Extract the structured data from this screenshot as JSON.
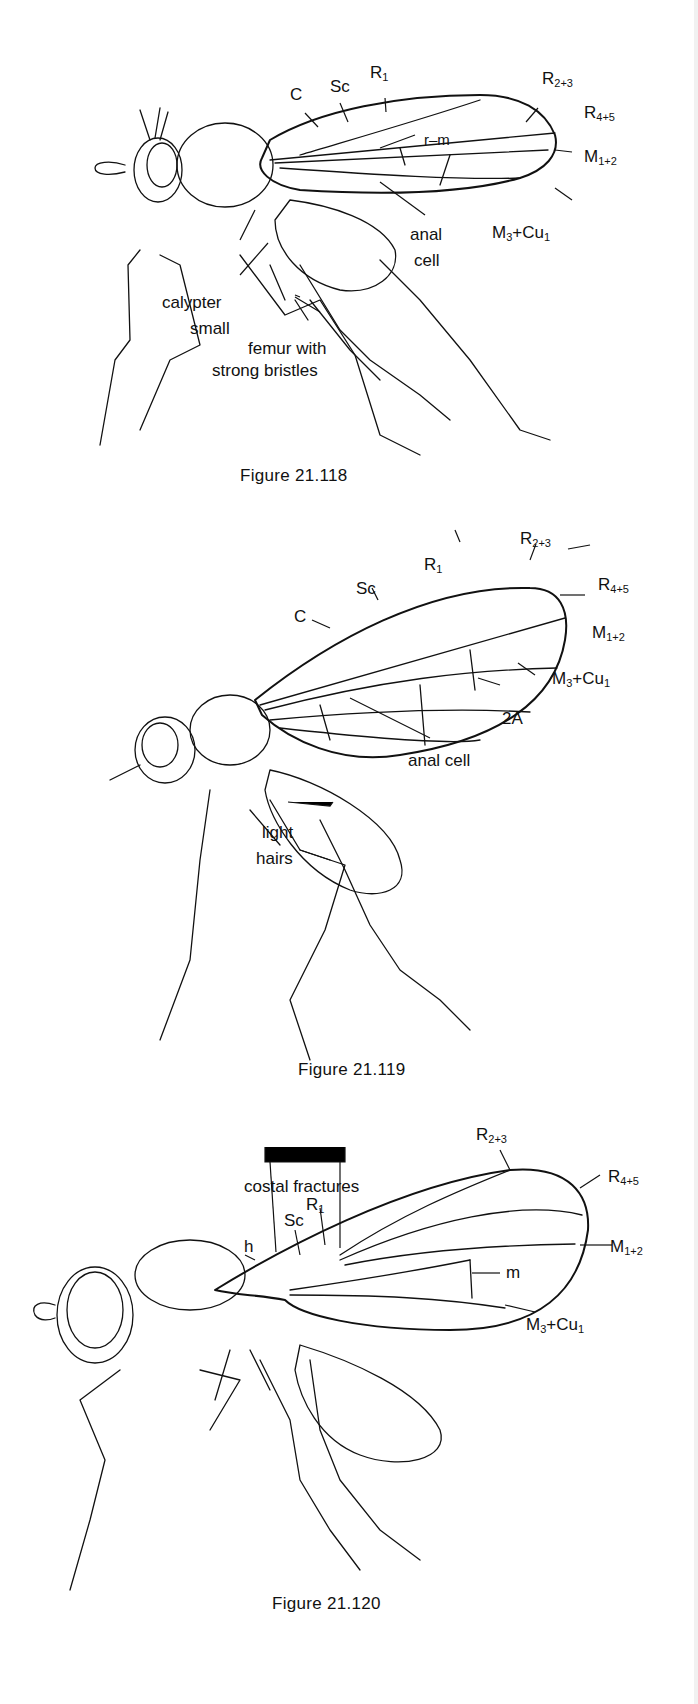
{
  "figures": [
    {
      "id": "fig-21-118",
      "caption": "Figure 21.118",
      "labels": {
        "c": "C",
        "sc": "Sc",
        "r1": "R",
        "r1_sub": "1",
        "r23": "R",
        "r23_sub": "2+3",
        "r45": "R",
        "r45_sub": "4+5",
        "rm": "r–m",
        "m12": "M",
        "m12_sub": "1+2",
        "m3cu1_a": "M",
        "m3cu1_a_sub": "3",
        "m3cu1_b": "+Cu",
        "m3cu1_b_sub": "1",
        "anal": "anal",
        "cell": "cell",
        "calypter": "calypter",
        "small": "small",
        "femur1": "femur with",
        "femur2": "strong bristles"
      }
    },
    {
      "id": "fig-21-119",
      "caption": "Figure 21.119",
      "labels": {
        "c": "C",
        "sc": "Sc",
        "r1": "R",
        "r1_sub": "1",
        "r23": "R",
        "r23_sub": "2+3",
        "r45": "R",
        "r45_sub": "4+5",
        "m12": "M",
        "m12_sub": "1+2",
        "m3cu1_a": "M",
        "m3cu1_a_sub": "3",
        "m3cu1_b": "+Cu",
        "m3cu1_b_sub": "1",
        "a2": "2A",
        "analcell": "anal cell",
        "light": "light",
        "hairs": "hairs"
      }
    },
    {
      "id": "fig-21-120",
      "caption": "Figure 21.120",
      "labels": {
        "costal": "costal fractures",
        "h": "h",
        "sc": "Sc",
        "r1": "R",
        "r1_sub": "1",
        "r23": "R",
        "r23_sub": "2+3",
        "r45": "R",
        "r45_sub": "4+5",
        "m12": "M",
        "m12_sub": "1+2",
        "m": "m",
        "m3cu1_a": "M",
        "m3cu1_a_sub": "3",
        "m3cu1_b": "+Cu",
        "m3cu1_b_sub": "1"
      }
    }
  ]
}
